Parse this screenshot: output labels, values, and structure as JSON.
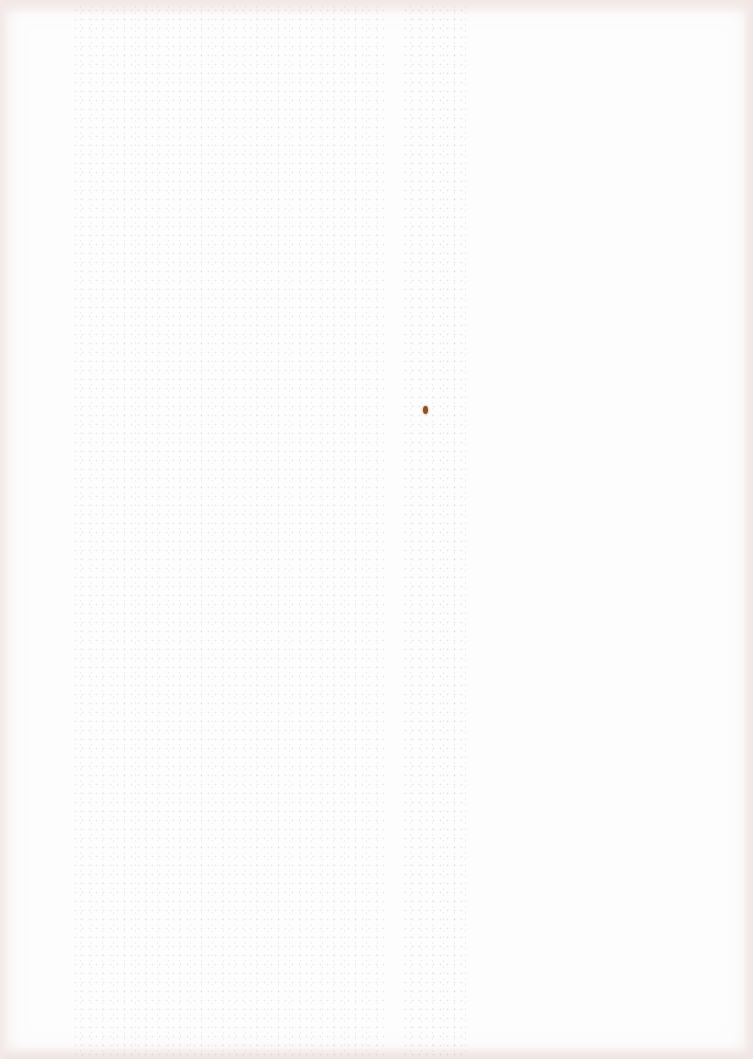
{
  "document": {
    "type": "scanned-page",
    "legible_text": [],
    "colors": {
      "paper": "#fefdfd",
      "edge_tint": "#f1e6e4",
      "bleed_through": "#968c8c",
      "spot": "#8a5326"
    },
    "regions": [
      {
        "name": "bleed-through-left-column",
        "x": 72,
        "y": 6,
        "width": 312,
        "height": 1050
      },
      {
        "name": "bleed-through-right-column",
        "x": 402,
        "y": 6,
        "width": 66,
        "height": 1050
      },
      {
        "name": "ink-spot",
        "x": 423,
        "y": 406,
        "width": 5,
        "height": 8
      }
    ]
  }
}
